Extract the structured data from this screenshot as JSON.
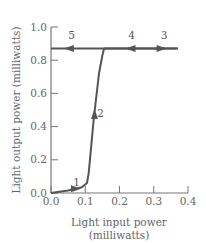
{
  "chart_data": {
    "type": "line",
    "title": "",
    "xlabel": "Light input power",
    "xlabel_units": "(milliwatts)",
    "ylabel": "Light output power (milliwatts)",
    "xlim": [
      0.0,
      0.4
    ],
    "ylim": [
      0.0,
      1.0
    ],
    "xticks": [
      "0.0",
      "0.1",
      "0.2",
      "0.3",
      "0.4"
    ],
    "yticks": [
      "0.0",
      "0.2",
      "0.4",
      "0.6",
      "0.8",
      "1.0"
    ],
    "grid": false,
    "legend": "none",
    "series": [
      {
        "name": "bistable hysteresis curve",
        "x": [
          0.0,
          0.05,
          0.09,
          0.105,
          0.11,
          0.125,
          0.14,
          0.15,
          0.155,
          0.37
        ],
        "y": [
          0.0,
          0.015,
          0.035,
          0.06,
          0.12,
          0.45,
          0.72,
          0.83,
          0.87,
          0.87
        ]
      },
      {
        "name": "upper branch",
        "x": [
          0.0,
          0.37
        ],
        "y": [
          0.87,
          0.87
        ]
      }
    ],
    "annotations": [
      {
        "label": "1",
        "x": 0.075,
        "y": 0.045,
        "arrow_direction": "right",
        "arrow_at": [
          0.07,
          0.025
        ]
      },
      {
        "label": "2",
        "x": 0.145,
        "y": 0.46,
        "arrow_direction": "up",
        "arrow_at": [
          0.127,
          0.47
        ]
      },
      {
        "label": "3",
        "x": 0.33,
        "y": 0.93,
        "arrow_direction": "right",
        "arrow_at": [
          0.32,
          0.87
        ]
      },
      {
        "label": "4",
        "x": 0.235,
        "y": 0.93,
        "arrow_direction": "left",
        "arrow_at": [
          0.235,
          0.87
        ]
      },
      {
        "label": "5",
        "x": 0.06,
        "y": 0.93,
        "arrow_direction": "left",
        "arrow_at": [
          0.055,
          0.87
        ]
      }
    ]
  },
  "colors": {
    "line": "#555555",
    "axis": "#777777",
    "text": "#666666"
  }
}
